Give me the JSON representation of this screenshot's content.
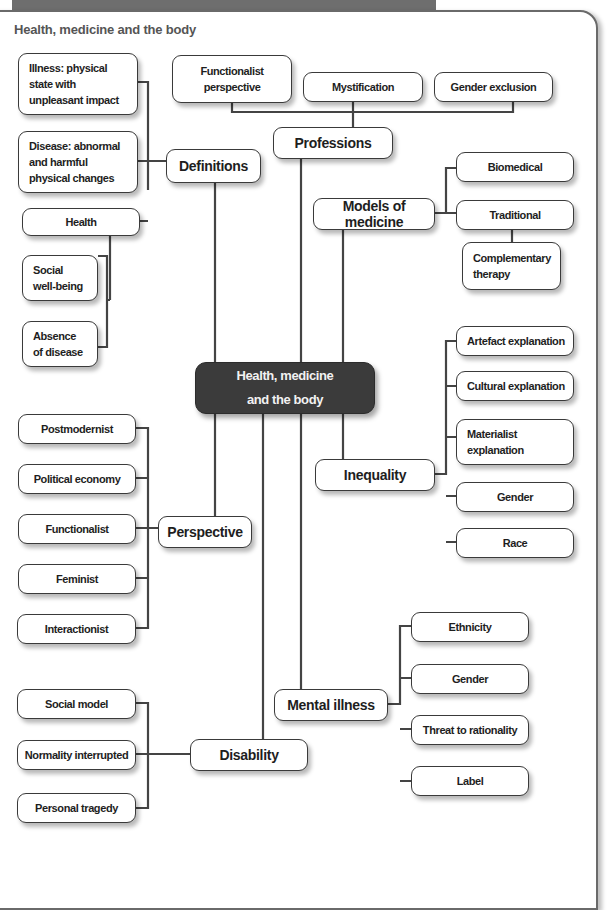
{
  "title": "Health, medicine and the body",
  "center": {
    "label": "Health, medicine\nand the body"
  },
  "branches": {
    "definitions": {
      "label": "Definitions",
      "children": [
        "Illness: physical\nstate with\nunpleasant impact",
        "Disease: abnormal\nand harmful\nphysical changes",
        "Health"
      ],
      "health_children": [
        "Social\nwell-being",
        "Absence\nof disease"
      ]
    },
    "professions": {
      "label": "Professions",
      "children": [
        "Functionalist\nperspective",
        "Mystification",
        "Gender exclusion"
      ]
    },
    "models": {
      "label": "Models of medicine",
      "children": [
        "Biomedical",
        "Traditional"
      ],
      "traditional_children": [
        "Complementary\ntherapy"
      ]
    },
    "inequality": {
      "label": "Inequality",
      "children": [
        "Artefact explanation",
        "Cultural explanation",
        "Materialist\nexplanation",
        "Gender",
        "Race"
      ]
    },
    "perspective": {
      "label": "Perspective",
      "children": [
        "Postmodernist",
        "Political economy",
        "Functionalist",
        "Feminist",
        "Interactionist"
      ]
    },
    "mental_illness": {
      "label": "Mental illness",
      "children": [
        "Ethnicity",
        "Gender",
        "Threat to rationality",
        "Label"
      ]
    },
    "disability": {
      "label": "Disability",
      "children": [
        "Social model",
        "Normality interrupted",
        "Personal tragedy"
      ]
    }
  },
  "colors": {
    "line": "#444444",
    "center_fill": "#3b3b3b",
    "frame": "#6a6a6a",
    "title_text": "#555555"
  }
}
